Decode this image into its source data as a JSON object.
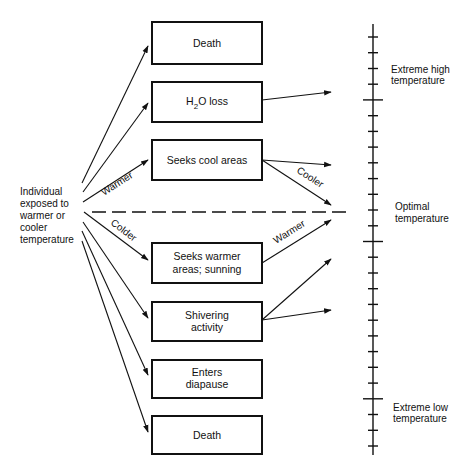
{
  "diagram": {
    "source": {
      "lines": [
        "Individual",
        "exposed to",
        "warmer or",
        "cooler",
        "temperature"
      ]
    },
    "branch_labels": {
      "warmer": "Warmer",
      "colder": "Colder"
    },
    "boxes": [
      {
        "id": "death-high",
        "lines": [
          "Death"
        ]
      },
      {
        "id": "h2o-loss",
        "lines": [
          "H",
          "2",
          "O loss"
        ]
      },
      {
        "id": "seeks-cool",
        "lines": [
          "Seeks cool areas"
        ]
      },
      {
        "id": "seeks-warmer",
        "lines": [
          "Seeks warmer",
          "areas; sunning"
        ]
      },
      {
        "id": "shivering",
        "lines": [
          "Shivering",
          "activity"
        ]
      },
      {
        "id": "diapause",
        "lines": [
          "Enters",
          "diapause"
        ]
      },
      {
        "id": "death-low",
        "lines": [
          "Death"
        ]
      }
    ],
    "response_labels": {
      "cooler": "Cooler",
      "warmer": "Warmer"
    },
    "scale": {
      "labels": {
        "extreme_high": [
          "Extreme high",
          "temperature"
        ],
        "optimal": [
          "Optimal",
          "temperature"
        ],
        "extreme_low": [
          "Extreme low",
          "temperature"
        ]
      },
      "tick_count": 27
    },
    "colors": {
      "line": "#111111",
      "background": "#ffffff"
    }
  }
}
